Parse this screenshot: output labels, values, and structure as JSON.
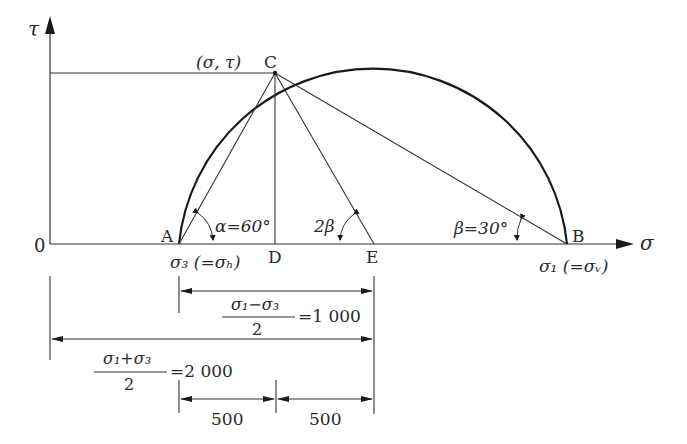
{
  "diagram": {
    "axes": {
      "y_label": "τ",
      "x_label": "σ",
      "origin_label": "0"
    },
    "points": {
      "C": {
        "label": "C",
        "coord_label": "(σ, τ)"
      },
      "A": {
        "label": "A",
        "sub_label": "σ₃ (=σₕ)"
      },
      "B": {
        "label": "B",
        "sub_label": "σ₁ (=σᵥ)"
      },
      "D": {
        "label": "D"
      },
      "E": {
        "label": "E"
      }
    },
    "angles": {
      "alpha": "α=60°",
      "two_beta": "2β",
      "beta": "β=30°"
    },
    "dimensions": {
      "half_difference": {
        "numerator": "σ₁−σ₃",
        "denominator": "2",
        "value": "=1 000"
      },
      "half_sum": {
        "numerator": "σ₁+σ₃",
        "denominator": "2",
        "value": "=2 000"
      },
      "segment_left": "500",
      "segment_right": "500"
    }
  }
}
